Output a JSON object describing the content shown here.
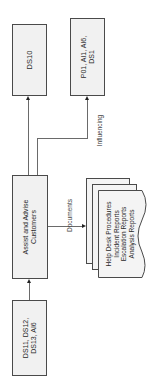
{
  "diagram": {
    "boxes": {
      "ds10": {
        "label": "DS10"
      },
      "p01": {
        "line1": "P01, AI1, AI6,",
        "line2": "DS1"
      },
      "assist": {
        "line1": "Assist and Advise",
        "line2": "Customers"
      },
      "inputs": {
        "line1": "DS11, DS12,",
        "line2": "DS13, AI6"
      }
    },
    "labels": {
      "documents": "Documents",
      "influencing": "Influencing"
    },
    "document_stack": {
      "items": [
        "Help Desk Procedures",
        "Incident Reports",
        "Escalation Reports",
        "Analysis Reports"
      ]
    },
    "colors": {
      "box_fill": "#f1f1f1",
      "border": "#4a4a4a",
      "line": "#6a6a6a"
    }
  }
}
